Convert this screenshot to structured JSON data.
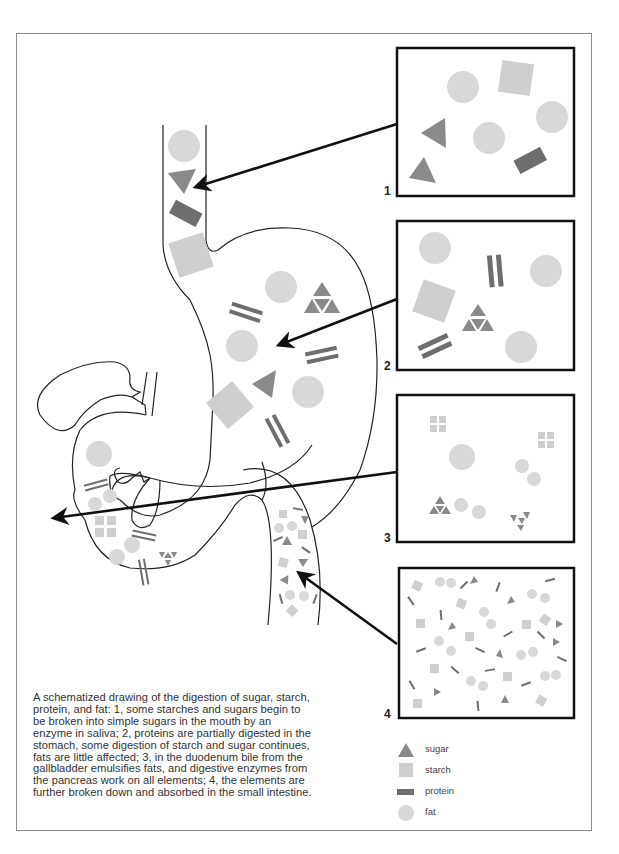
{
  "figure": {
    "caption": "A schematized drawing of the digestion of sugar, starch, protein, and fat: 1, some starches and sugars begin to be broken into simple sugars in the mouth by an enzyme in saliva; 2, proteins are partially digested in the stomach, some digestion of starch and sugar continues, fats are little affected; 3, in the duodenum bile from the gallbladder emulsifies fats, and digestive enzymes from the pancreas work on all elements; 4, the elements are further broken down and absorbed in the small intestine.",
    "panels": [
      {
        "number": "1",
        "stage": "mouth / esophagus"
      },
      {
        "number": "2",
        "stage": "stomach"
      },
      {
        "number": "3",
        "stage": "duodenum"
      },
      {
        "number": "4",
        "stage": "small intestine"
      }
    ]
  },
  "legend": {
    "items": [
      {
        "label": "sugar",
        "shape": "triangle",
        "color": "#8a8a8a"
      },
      {
        "label": "starch",
        "shape": "square",
        "color": "#cfcfcf"
      },
      {
        "label": "protein",
        "shape": "rectangle",
        "color": "#6e6e6e"
      },
      {
        "label": "fat",
        "shape": "circle",
        "color": "#d8d8d8"
      }
    ]
  },
  "colors": {
    "sugar": "#8a8a8a",
    "starch": "#cfcfcf",
    "protein": "#6e6e6e",
    "fat": "#d8d8d8",
    "outline": "#222222",
    "box_border": "#111111"
  }
}
